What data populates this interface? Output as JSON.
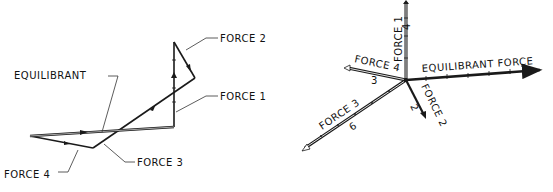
{
  "left_diagram": {
    "title": "Force polygon",
    "labels": {
      "force2": "FORCE 2",
      "equilibrant": "EQUILIBRANT",
      "force1": "FORCE 1",
      "force3": "FORCE 3",
      "force4": "FORCE 4"
    }
  },
  "right_diagram": {
    "title": "Concurrent force vectors",
    "labels": {
      "force1": "FORCE 1",
      "force1_mag": "4",
      "force4": "FORCE 4",
      "force4_mag": "3",
      "equilibrant": "EQUILIBRANT FORCE",
      "force3": "FORCE 3",
      "force3_mag": "6",
      "force2": "FORCE 2",
      "force2_mag": "2"
    }
  },
  "colors": {
    "line": "#1a1a1a",
    "leader": "#333333",
    "background": "#ffffff"
  }
}
